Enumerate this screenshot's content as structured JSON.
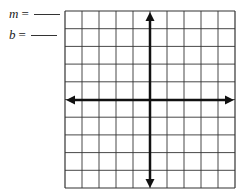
{
  "labels": {
    "m": {
      "variable": "m",
      "equals": "=",
      "value": ""
    },
    "b": {
      "variable": "b",
      "equals": "=",
      "value": ""
    }
  },
  "grid": {
    "columns": 10,
    "rows": 10,
    "x_axis_column": 5,
    "y_axis_row": 5,
    "line_color": "#333333",
    "axis_color": "#111111"
  }
}
